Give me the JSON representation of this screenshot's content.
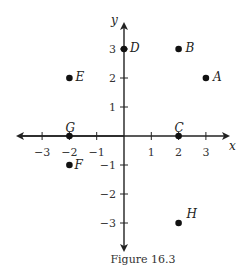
{
  "chart_data": {
    "type": "scatter",
    "title": "",
    "caption": "Figure 16.3",
    "xlabel": "x",
    "ylabel": "y",
    "xlim": [
      -3.8,
      3.8
    ],
    "ylim": [
      -3.8,
      3.8
    ],
    "grid": false,
    "x_ticks": [
      -3,
      -2,
      -1,
      1,
      2,
      3
    ],
    "y_ticks": [
      3,
      2,
      1,
      -1,
      -2,
      -3
    ],
    "x_tick_labels": [
      "−3",
      "−2",
      "−1",
      "1",
      "2",
      "3"
    ],
    "y_tick_labels": [
      "3",
      "2",
      "1",
      "−1",
      "−2",
      "−3"
    ],
    "points": [
      {
        "label": "A",
        "x": 3,
        "y": 2
      },
      {
        "label": "B",
        "x": 2,
        "y": 3
      },
      {
        "label": "C",
        "x": 2,
        "y": 0
      },
      {
        "label": "D",
        "x": 0,
        "y": 3
      },
      {
        "label": "E",
        "x": -2,
        "y": 2
      },
      {
        "label": "F",
        "x": -2,
        "y": -1
      },
      {
        "label": "G",
        "x": -2,
        "y": 0
      },
      {
        "label": "H",
        "x": 2,
        "y": -3
      }
    ]
  }
}
